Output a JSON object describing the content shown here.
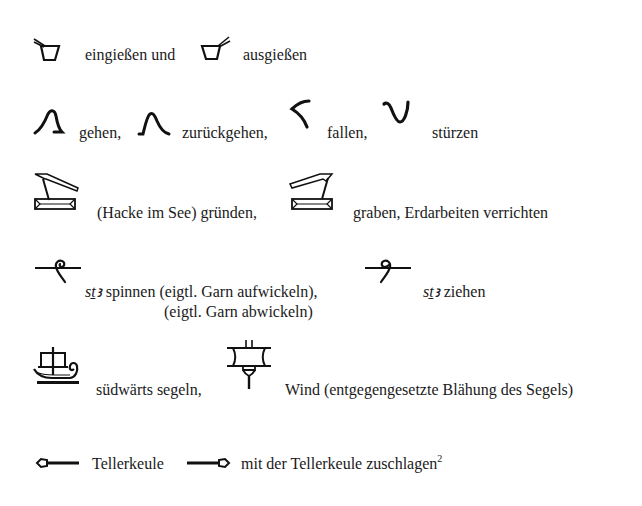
{
  "rows": {
    "pour": {
      "glyph1": "pour-in-vessel-icon",
      "text1": "eingießen und",
      "glyph2": "pour-out-vessel-icon",
      "text2": "ausgießen"
    },
    "walk": {
      "glyph1": "walking-legs-icon",
      "text1": "gehen,",
      "glyph2": "walking-back-legs-icon",
      "text2": "zurückgehen,",
      "glyph3": "falling-icon",
      "text3": "fallen,",
      "glyph4": "overturn-icon",
      "text4": "stürzen"
    },
    "hoe": {
      "glyph1": "hoe-in-lake-icon",
      "text1": "(Hacke im See) gründen,",
      "glyph2": "hoe-in-lake-reversed-icon",
      "text2": "graben, Erdarbeiten verrichten"
    },
    "spin": {
      "glyph1": "spindle-icon",
      "translit1": "sṯꜣ",
      "text1": " spinnen (eigtl. Garn aufwickeln),",
      "text1b": "(eigtl. Garn abwickeln)",
      "glyph2": "spindle-reversed-icon",
      "translit2": "sṯꜣ",
      "text2": " ziehen"
    },
    "sail": {
      "glyph1": "ship-with-sail-icon",
      "text1": "südwärts segeln,",
      "glyph2": "sail-mast-icon",
      "text2": "Wind (entgegengesetzte Blähung des Segels)"
    },
    "mace": {
      "glyph1": "mace-left-icon",
      "text1": "Tellerkeule",
      "glyph2": "mace-right-icon",
      "text2": "mit der Tellerkeule zuschlagen",
      "footnote": "2"
    }
  }
}
